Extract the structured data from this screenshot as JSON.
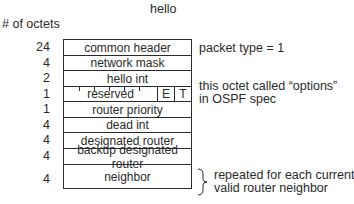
{
  "title": "hello",
  "octets_header": "# of octets",
  "fields": [
    {
      "octets": "24",
      "name": "common header"
    },
    {
      "octets": "4",
      "name": "network mask"
    },
    {
      "octets": "2",
      "name": "hello int"
    },
    {
      "octets": "1",
      "name": "reserved",
      "bits": [
        "E",
        "T"
      ]
    },
    {
      "octets": "1",
      "name": "router priority"
    },
    {
      "octets": "4",
      "name": "dead int"
    },
    {
      "octets": "4",
      "name": "designated router"
    },
    {
      "octets": "4",
      "name": "backup designated router"
    },
    {
      "octets": "4",
      "name": "neighbor"
    }
  ],
  "annotations": {
    "common_header": "packet type = 1",
    "options_line1": "this octet called “options”",
    "options_line2": "in OSPF spec",
    "neighbor_line1": "repeated for each current",
    "neighbor_line2": "valid router neighbor"
  }
}
